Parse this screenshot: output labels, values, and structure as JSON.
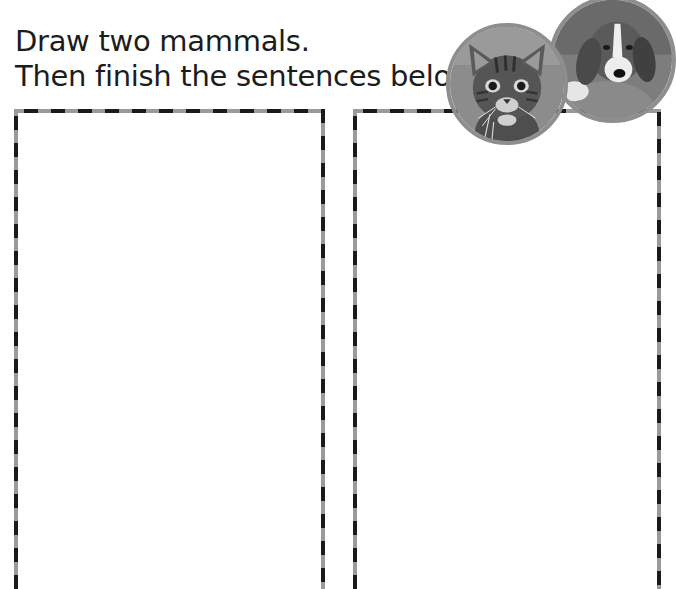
{
  "instructions": {
    "line1": "Draw two mammals.",
    "line2": "Then finish the sentences below."
  },
  "drawing_areas": [
    {
      "id": "mammal-1",
      "label": "Drawing area 1"
    },
    {
      "id": "mammal-2",
      "label": "Drawing area 2"
    }
  ],
  "photos": [
    {
      "subject": "dog-photo",
      "description": "beagle puppy"
    },
    {
      "subject": "kitten-photo",
      "description": "tabby kitten"
    }
  ],
  "colors": {
    "dash_dark": "#1a1a1a",
    "dash_light": "#9a9a9a",
    "photo_border": "#8e8e8e",
    "text": "#1c1c1c"
  }
}
